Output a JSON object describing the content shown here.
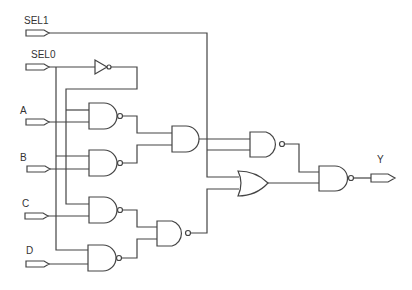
{
  "diagram": {
    "type": "logic-circuit",
    "inputs": [
      {
        "id": "sel1",
        "label": "SEL1"
      },
      {
        "id": "sel0",
        "label": "SEL0"
      },
      {
        "id": "a",
        "label": "A"
      },
      {
        "id": "b",
        "label": "B"
      },
      {
        "id": "c",
        "label": "C"
      },
      {
        "id": "d",
        "label": "D"
      }
    ],
    "outputs": [
      {
        "id": "y",
        "label": "Y"
      }
    ],
    "gates": [
      {
        "id": "inv1",
        "type": "NOT",
        "inputs": [
          "SEL0"
        ]
      },
      {
        "id": "nand_a",
        "type": "NAND",
        "inputs": [
          "~SEL0",
          "A"
        ]
      },
      {
        "id": "nand_b",
        "type": "NAND",
        "inputs": [
          "SEL0",
          "B"
        ]
      },
      {
        "id": "nand_c",
        "type": "NAND",
        "inputs": [
          "~SEL0",
          "C"
        ]
      },
      {
        "id": "nand_d",
        "type": "NAND",
        "inputs": [
          "SEL0",
          "D"
        ]
      },
      {
        "id": "and_ab",
        "type": "AND",
        "inputs": [
          "nand_a",
          "nand_b"
        ]
      },
      {
        "id": "nand_cd",
        "type": "NAND",
        "inputs": [
          "nand_c",
          "nand_d"
        ]
      },
      {
        "id": "nand_top",
        "type": "NAND",
        "inputs": [
          "and_ab",
          "SEL1"
        ]
      },
      {
        "id": "or_bot",
        "type": "OR",
        "inputs": [
          "SEL1",
          "nand_cd"
        ]
      },
      {
        "id": "nand_out",
        "type": "NAND",
        "inputs": [
          "nand_top",
          "or_bot"
        ]
      }
    ]
  }
}
